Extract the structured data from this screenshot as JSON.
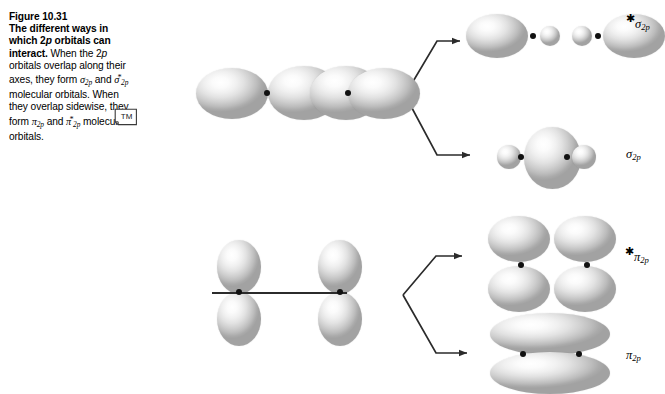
{
  "figure": {
    "number": "Figure 10.31",
    "title": "The different ways in which 2p orbitals can interact.",
    "body_part1": "When the 2",
    "body_p_italic": "p",
    "body_part2": " orbitals overlap along their axes, they form ",
    "sigma_sym": "σ",
    "sigma_sub": "2p",
    "body_and": " and ",
    "sigma_star_sym": "σ",
    "sigma_star_sub": "2p",
    "star": "*",
    "body_part3": " molecular orbitals. When they overlap sidewise, they form ",
    "pi_sym": "π",
    "pi_sub": "2p",
    "pi_star_sym": "π",
    "pi_star_sub": "2p",
    "body_end": " molecular orbitals.",
    "watermark": "TM"
  },
  "labels": {
    "sigma_star": {
      "greek": "σ",
      "sub": "2p",
      "star": "*",
      "full": "σ*2p"
    },
    "sigma": {
      "greek": "σ",
      "sub": "2p",
      "star": "",
      "full": "σ2p"
    },
    "pi_star": {
      "greek": "π",
      "sub": "2p",
      "star": "*",
      "full": "π*2p"
    },
    "pi": {
      "greek": "π",
      "sub": "2p",
      "star": "",
      "full": "π2p"
    }
  },
  "colors": {
    "orbital_light": "#ffffff",
    "orbital_mid": "#d0d0d0",
    "orbital_edge": "#a2a2a2",
    "nucleus": "#111111",
    "line": "#2b2b2b",
    "background": "#ffffff",
    "text": "#000000"
  },
  "diagram": {
    "top_row_caption": "end-on (axial) 2p overlap producing sigma molecular orbitals",
    "bottom_row_caption": "sidewise (lateral) 2p overlap producing pi molecular orbitals",
    "reactant_top_lobes": 4,
    "reactant_bottom_lobes": 4,
    "nuclei_per_system": 2
  }
}
